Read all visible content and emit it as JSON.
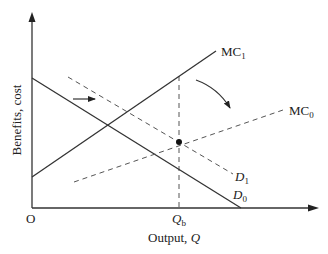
{
  "diagram": {
    "type": "economics-supply-demand",
    "axes": {
      "x_label": "Output, ",
      "x_label_var": "Q",
      "y_label": "Benefits, cost",
      "origin_label": "O"
    },
    "tick": {
      "label": "Q",
      "subscript": "b"
    },
    "curves": {
      "mc1": {
        "label": "MC",
        "subscript": "1",
        "style": "solid"
      },
      "mc0": {
        "label": "MC",
        "subscript": "0",
        "style": "dashed"
      },
      "d0": {
        "label": "D",
        "subscript": "0",
        "style": "solid"
      },
      "d1": {
        "label": "D",
        "subscript": "1",
        "style": "dashed"
      }
    },
    "annotations": {
      "shift_arrow_demand": "right-arrow",
      "shift_arrow_mc": "curved-arrow-down-right",
      "equilibrium_point": "dot at intersection of MC0 and D1"
    },
    "colors": {
      "line": "#333333",
      "dashed": "#555555",
      "background": "#ffffff"
    }
  }
}
